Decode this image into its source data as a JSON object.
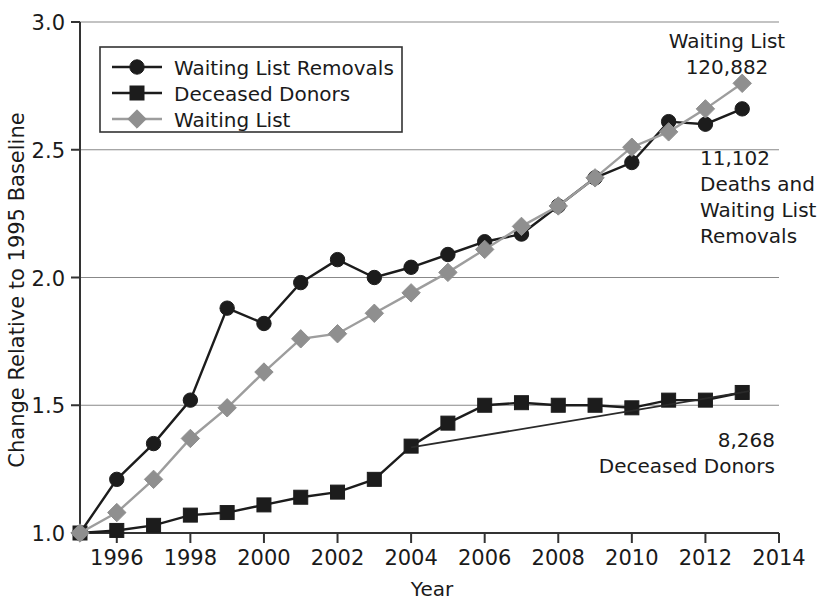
{
  "chart_data": {
    "type": "line",
    "title": "",
    "xlabel": "Year",
    "ylabel": "Change Relative to 1995 Baseline",
    "xlim": [
      1995,
      2014
    ],
    "ylim": [
      1.0,
      3.0
    ],
    "grid": true,
    "legend_position": "top-left",
    "x": [
      1995,
      1996,
      1997,
      1998,
      1999,
      2000,
      2001,
      2002,
      2003,
      2004,
      2005,
      2006,
      2007,
      2008,
      2009,
      2010,
      2011,
      2012,
      2013
    ],
    "xticks": [
      "1996",
      "1998",
      "2000",
      "2002",
      "2004",
      "2006",
      "2008",
      "2010",
      "2012",
      "2014"
    ],
    "xtick_values": [
      1996,
      1998,
      2000,
      2002,
      2004,
      2006,
      2008,
      2010,
      2012,
      2014
    ],
    "yticks": [
      "1.0",
      "1.5",
      "2.0",
      "2.5",
      "3.0"
    ],
    "ytick_values": [
      1.0,
      1.5,
      2.0,
      2.5,
      3.0
    ],
    "series": [
      {
        "name": "Waiting List Removals",
        "marker": "circle",
        "color": "#1c1c1c",
        "values": [
          1.0,
          1.21,
          1.35,
          1.52,
          1.88,
          1.82,
          1.98,
          2.07,
          2.0,
          2.04,
          2.09,
          2.14,
          2.17,
          2.28,
          2.39,
          2.45,
          2.61,
          2.6,
          2.66
        ]
      },
      {
        "name": "Deceased Donors",
        "marker": "square",
        "color": "#1c1c1c",
        "values": [
          1.0,
          1.01,
          1.03,
          1.07,
          1.08,
          1.11,
          1.14,
          1.16,
          1.21,
          1.34,
          1.43,
          1.5,
          1.51,
          1.5,
          1.5,
          1.49,
          1.52,
          1.52,
          1.55
        ]
      },
      {
        "name": "Waiting List",
        "marker": "diamond",
        "color": "#8f8f8f",
        "values": [
          1.0,
          1.08,
          1.21,
          1.37,
          1.49,
          1.63,
          1.76,
          1.78,
          1.86,
          1.94,
          2.02,
          2.11,
          2.2,
          2.28,
          2.39,
          2.51,
          2.57,
          2.66,
          2.76
        ]
      }
    ],
    "annotations": [
      {
        "id": "waiting-list-annotation",
        "lines": [
          "Waiting List",
          "120,882"
        ],
        "align": "center",
        "x": 2013.0,
        "y": 2.92
      },
      {
        "id": "deaths-removals-annotation",
        "lines": [
          "11,102",
          "Deaths and",
          "Waiting List",
          "Removals"
        ],
        "align": "left",
        "x": 2013.0,
        "y": 2.45
      },
      {
        "id": "deceased-donors-annotation",
        "lines": [
          "8,268",
          "Deceased Donors"
        ],
        "align": "right",
        "x": 2013.0,
        "y": 1.36
      }
    ]
  },
  "legend": {
    "entries": [
      {
        "label": "Waiting List Removals",
        "marker": "circle",
        "color": "#1c1c1c"
      },
      {
        "label": "Deceased Donors",
        "marker": "square",
        "color": "#1c1c1c"
      },
      {
        "label": "Waiting List",
        "marker": "diamond",
        "color": "#8f8f8f"
      }
    ]
  },
  "axis_titles": {
    "x": "Year",
    "y": "Change Relative to 1995 Baseline"
  }
}
